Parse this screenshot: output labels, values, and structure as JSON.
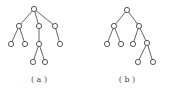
{
  "figure": {
    "node_radius": 2.6,
    "colors": {
      "edge": "#555555",
      "node_stroke": "#444444",
      "node_fill": "#ffffff",
      "label": "#444444"
    },
    "trees": [
      {
        "id": "a",
        "caption": "( a )",
        "caption_pos": [
          39,
          82
        ],
        "nodes": [
          {
            "id": "r",
            "x": 34,
            "y": 9
          },
          {
            "id": "n1",
            "x": 19,
            "y": 26
          },
          {
            "id": "n2",
            "x": 39,
            "y": 26
          },
          {
            "id": "n3",
            "x": 55,
            "y": 26
          },
          {
            "id": "n4",
            "x": 11,
            "y": 44
          },
          {
            "id": "n5",
            "x": 25,
            "y": 44
          },
          {
            "id": "n6",
            "x": 39,
            "y": 44
          },
          {
            "id": "n7",
            "x": 60,
            "y": 44
          },
          {
            "id": "n8",
            "x": 33,
            "y": 62
          },
          {
            "id": "n9",
            "x": 45,
            "y": 62
          }
        ],
        "edges": [
          [
            "r",
            "n1"
          ],
          [
            "r",
            "n2"
          ],
          [
            "r",
            "n3"
          ],
          [
            "n1",
            "n4"
          ],
          [
            "n1",
            "n5"
          ],
          [
            "n2",
            "n6"
          ],
          [
            "n3",
            "n7"
          ],
          [
            "n6",
            "n8"
          ],
          [
            "n6",
            "n9"
          ]
        ]
      },
      {
        "id": "b",
        "caption": "( b )",
        "caption_pos": [
          127,
          82
        ],
        "nodes": [
          {
            "id": "r",
            "x": 127,
            "y": 10
          },
          {
            "id": "n1",
            "x": 114,
            "y": 26
          },
          {
            "id": "n2",
            "x": 139,
            "y": 26
          },
          {
            "id": "n3",
            "x": 107,
            "y": 44
          },
          {
            "id": "n4",
            "x": 121,
            "y": 44
          },
          {
            "id": "n5",
            "x": 133,
            "y": 44
          },
          {
            "id": "n6",
            "x": 147,
            "y": 43
          },
          {
            "id": "n7",
            "x": 138,
            "y": 62
          },
          {
            "id": "n8",
            "x": 153,
            "y": 62
          }
        ],
        "edges": [
          [
            "r",
            "n1"
          ],
          [
            "r",
            "n2"
          ],
          [
            "n1",
            "n3"
          ],
          [
            "n1",
            "n4"
          ],
          [
            "n2",
            "n5"
          ],
          [
            "n2",
            "n6"
          ],
          [
            "n6",
            "n7"
          ],
          [
            "n6",
            "n8"
          ]
        ]
      }
    ]
  }
}
